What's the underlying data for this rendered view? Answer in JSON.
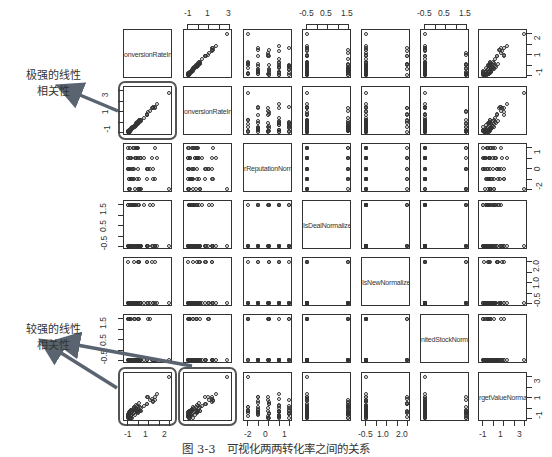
{
  "figure": {
    "caption": "图 3-3　可视化两两转化率之间的关系",
    "annotations": [
      {
        "id": "strong",
        "line1": "极强的线性",
        "line2": "相关性",
        "x": 30,
        "y": 72
      },
      {
        "id": "fairly-strong",
        "line1": "较强的线性",
        "line2": "相关性",
        "x": 30,
        "y": 333
      }
    ],
    "colors": {
      "ink": "#333333",
      "arrow": "#5a6470",
      "highlight": "#555555"
    }
  },
  "chart_data": {
    "type": "scatter",
    "subtype": "pairs-matrix",
    "title": "可视化两两转化率之间的关系",
    "variables": [
      "ConversionRateInUV",
      "ConversionRateInUV2",
      "SellerReputationNormalized",
      "IsDealNormalized",
      "IsNewNormalized",
      "LimitedStockNormalized",
      "TargetValueNormalized"
    ],
    "diagonal_labels_visible": [
      "onversionRateInU'",
      "onversionRateInU'",
      "rReputationNorma",
      "IsDealNormalized",
      "IsNewNormalized",
      "nitedStockNormal",
      "rgetValueNormaliz"
    ],
    "axes": {
      "top": [
        {
          "col": 2,
          "ticks": [
            "-1",
            "1",
            "3"
          ]
        },
        {
          "col": 4,
          "ticks": [
            "-0.5",
            "0.5",
            "1.5"
          ]
        },
        {
          "col": 6,
          "ticks": [
            "-0.5",
            "0.5",
            "1.5"
          ]
        }
      ],
      "bottom": [
        {
          "col": 1,
          "ticks": [
            "-1",
            "1",
            "2"
          ]
        },
        {
          "col": 3,
          "ticks": [
            "-2",
            "0",
            "1"
          ]
        },
        {
          "col": 5,
          "ticks": [
            "-0.5",
            "1.0",
            "2.0"
          ]
        },
        {
          "col": 7,
          "ticks": [
            "-1",
            "1",
            "3"
          ]
        }
      ],
      "left": [
        {
          "row": 2,
          "ticks": [
            "-1",
            "1",
            "3"
          ]
        },
        {
          "row": 4,
          "ticks": [
            "-0.5",
            "0.5",
            "1.5"
          ]
        },
        {
          "row": 6,
          "ticks": [
            "-0.5",
            "0.5",
            "1.5"
          ]
        }
      ],
      "right": [
        {
          "row": 1,
          "ticks": [
            "-1",
            "1",
            "2"
          ]
        },
        {
          "row": 3,
          "ticks": [
            "-2",
            "0",
            "1"
          ]
        },
        {
          "row": 5,
          "ticks": [
            "-0.5",
            "1.0",
            "2.0"
          ]
        },
        {
          "row": 7,
          "ticks": [
            "-1",
            "1",
            "3"
          ]
        }
      ]
    },
    "highlighted_panels": [
      {
        "row": 2,
        "col": 1,
        "label": "极强的线性相关性"
      },
      {
        "row": 7,
        "col": 1,
        "label": "较强的线性相关性"
      },
      {
        "row": 7,
        "col": 2,
        "label": "较强的线性相关性"
      }
    ],
    "correlation_notes": {
      "ConversionRateInUV~ConversionRateInUV2": "very strong linear",
      "ConversionRateInUV~TargetValueNormalized": "fairly strong linear",
      "ConversionRateInUV2~TargetValueNormalized": "fairly strong linear"
    },
    "grid": false,
    "legend": null
  }
}
